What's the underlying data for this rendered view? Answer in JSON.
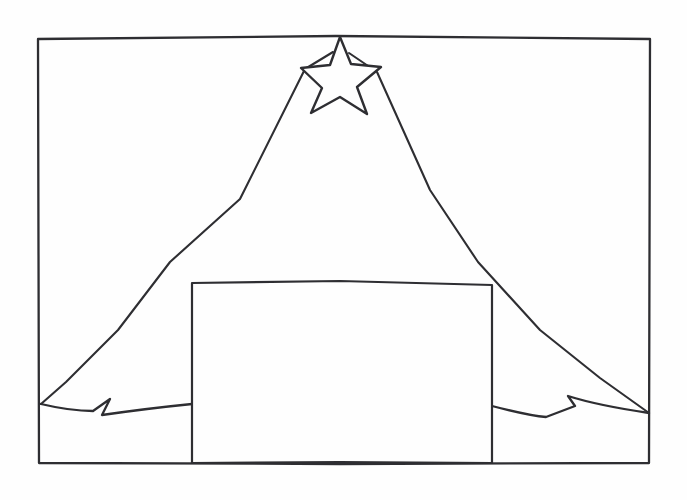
{
  "artwork": {
    "title": "Tent with Star and Manger Box",
    "medium": "hand-drawn pen line sketch",
    "background_color": "#fefefe",
    "ink_color": "#2e2e32",
    "canvas": {
      "width": 687,
      "height": 500
    }
  },
  "frame": {
    "label": "Picture Border",
    "x": 38,
    "y": 38,
    "width": 612,
    "height": 426,
    "path": "M 38 39 L 336 36 L 650 39 L 649 463 L 340 464 L 39 463 Z"
  },
  "star": {
    "label": "Star",
    "points": 5,
    "center_x": 341,
    "center_y": 74,
    "outer_radius": 41,
    "inner_radius": 17,
    "path": "M 340 37 L 330 65 L 301 68 L 322 88 L 311 113 L 340 97 L 367 114 L 357 87 L 381 67 L 351 64 Z"
  },
  "tent": {
    "label": "Tent Triangle",
    "apex_x": 340,
    "apex_y": 45,
    "left_foot_x": 41,
    "left_foot_y": 404,
    "right_foot_x": 649,
    "right_foot_y": 413,
    "left_leg_path": "M 333 52 L 305 69 L 240 199 L 170 262 L 118 330 L 66 382 L 41 404",
    "right_leg_path": "M 349 53 L 377 72 L 430 190 L 478 262 L 540 330 L 600 378 L 649 413"
  },
  "box": {
    "label": "Manger Box",
    "x": 192,
    "y": 282,
    "width": 300,
    "height": 182,
    "path": "M 192 283 L 340 281 L 492 285 L 492 380 L 492 463 L 340 462 L 192 463 L 192 380 Z"
  },
  "ground": {
    "label": "Ground Flaps",
    "left_path": "M 41 404 C 62 409 78 411 93 411 L 110 399 L 102 415 C 130 411 162 407 192 404",
    "right_path": "M 492 406 C 515 412 532 416 546 417 L 575 406 L 568 396 C 590 403 622 409 649 413",
    "left_notch_peak_x": 110,
    "left_notch_valley_x": 102,
    "right_notch_peak_x": 568,
    "right_notch_valley_x": 575
  }
}
